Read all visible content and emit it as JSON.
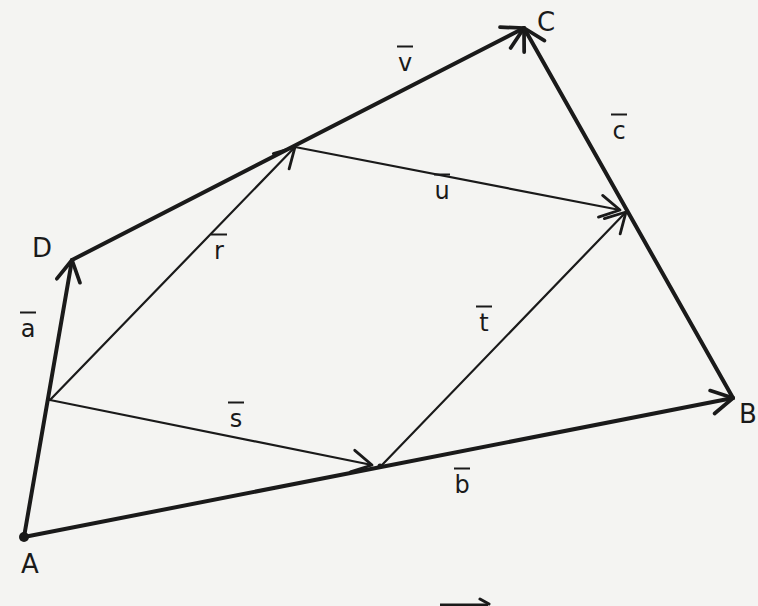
{
  "diagram": {
    "type": "vector-geometry",
    "stroke_color": "#1a1a1a",
    "background": "#f4f4f2",
    "points": {
      "A": {
        "label": "A",
        "x": 24,
        "y": 537
      },
      "B": {
        "label": "B",
        "x": 733,
        "y": 398
      },
      "C": {
        "label": "C",
        "x": 524,
        "y": 28
      },
      "D": {
        "label": "D",
        "x": 72,
        "y": 260
      },
      "M_AD": {
        "x": 50,
        "y": 400
      },
      "M_DC": {
        "x": 295,
        "y": 147
      },
      "M_CB": {
        "x": 626,
        "y": 212
      },
      "M_AB": {
        "x": 380,
        "y": 466
      }
    },
    "point_labels": [
      {
        "name": "A",
        "text": "A",
        "x": 30,
        "y": 564
      },
      {
        "name": "B",
        "text": "B",
        "x": 748,
        "y": 414
      },
      {
        "name": "C",
        "text": "C",
        "x": 546,
        "y": 22
      },
      {
        "name": "D",
        "text": "D",
        "x": 42,
        "y": 248
      }
    ],
    "vectors": [
      {
        "name": "a",
        "text": "a",
        "from": "A",
        "to": "D",
        "label_x": 28,
        "label_y": 328
      },
      {
        "name": "b",
        "text": "b",
        "from": "A",
        "to": "B",
        "label_x": 462,
        "label_y": 484
      },
      {
        "name": "c",
        "text": "c",
        "from": "B",
        "to": "C",
        "label_x": 619,
        "label_y": 130
      },
      {
        "name": "v",
        "text": "v",
        "from": "D",
        "to": "C",
        "label_x": 405,
        "label_y": 62
      },
      {
        "name": "r",
        "text": "r",
        "from": "M_AD",
        "to": "M_DC",
        "label_x": 219,
        "label_y": 250
      },
      {
        "name": "s",
        "text": "s",
        "from": "M_AD",
        "to": "M_AB",
        "label_x": 236,
        "label_y": 418
      },
      {
        "name": "t",
        "text": "t",
        "from": "M_AB",
        "to": "M_CB",
        "label_x": 486,
        "label_y": 322
      },
      {
        "name": "u",
        "text": "u",
        "from": "M_DC",
        "to": "M_CB",
        "label_x": 442,
        "label_y": 190
      }
    ],
    "segments_bold": [
      "A-D",
      "D-C",
      "B-C",
      "A-B"
    ],
    "segments_thin": [
      "M_AD-M_DC",
      "M_AD-M_AB",
      "M_AB-M_CB",
      "M_DC-M_CB"
    ]
  }
}
